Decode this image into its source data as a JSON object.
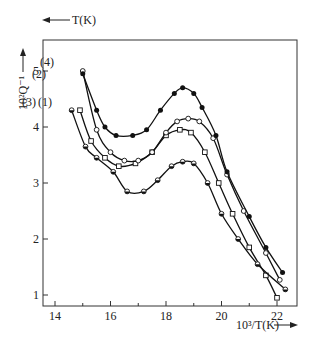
{
  "chart_data": {
    "type": "line",
    "title": "",
    "xlabel": "10³/T(K)",
    "ylabel": "10²Q⁻¹",
    "top_axis_label": "T(K)",
    "xlim": [
      13.6,
      22.8
    ],
    "ylim": [
      0.8,
      5.55
    ],
    "x_ticks": [
      14,
      16,
      18,
      20,
      22
    ],
    "y_ticks": [
      1,
      2,
      3,
      4,
      5
    ],
    "top_ticks": [
      700,
      600,
      500
    ],
    "grid": false,
    "legend": "inline labels (1)-(4)",
    "series": [
      {
        "name": "(1)",
        "marker": "open-square",
        "x": [
          14.9,
          15.3,
          15.8,
          16.3,
          16.9,
          17.5,
          18.0,
          18.5,
          18.9,
          19.4,
          19.9,
          20.4,
          21.0,
          21.6,
          22.0
        ],
        "y": [
          4.3,
          3.75,
          3.45,
          3.3,
          3.35,
          3.55,
          3.85,
          3.95,
          3.9,
          3.55,
          3.0,
          2.45,
          1.85,
          1.35,
          0.95
        ]
      },
      {
        "name": "(2)",
        "marker": "open-circle",
        "x": [
          15.0,
          15.5,
          16.0,
          16.5,
          17.0,
          17.5,
          18.0,
          18.4,
          18.8,
          19.2,
          19.7,
          20.2,
          20.8,
          21.6,
          22.1
        ],
        "y": [
          5.0,
          3.95,
          3.55,
          3.4,
          3.4,
          3.55,
          3.9,
          4.1,
          4.15,
          4.1,
          3.8,
          3.15,
          2.5,
          1.75,
          1.27
        ]
      },
      {
        "name": "(3)",
        "marker": "half-filled-circle",
        "x": [
          14.6,
          15.1,
          15.5,
          16.1,
          16.6,
          17.2,
          17.7,
          18.2,
          18.6,
          19.0,
          19.5,
          20.0,
          20.6,
          21.3,
          22.3
        ],
        "y": [
          4.3,
          3.65,
          3.45,
          3.2,
          2.85,
          2.85,
          3.05,
          3.3,
          3.38,
          3.35,
          3.0,
          2.45,
          2.0,
          1.55,
          1.1
        ]
      },
      {
        "name": "(4)",
        "marker": "filled-circle",
        "x": [
          15.0,
          15.5,
          15.8,
          16.2,
          16.8,
          17.3,
          17.8,
          18.3,
          18.6,
          19.0,
          19.3,
          19.8,
          20.2,
          21.0,
          21.6,
          22.2
        ],
        "y": [
          4.95,
          4.3,
          4.0,
          3.85,
          3.85,
          3.95,
          4.3,
          4.6,
          4.7,
          4.6,
          4.35,
          3.85,
          3.2,
          2.4,
          1.85,
          1.4
        ]
      }
    ]
  },
  "labels": {
    "xlabel": "10³/T(K)",
    "ylabel": "10²Q⁻¹",
    "top_label": "T(K)",
    "x_ticks": [
      "14",
      "16",
      "18",
      "20",
      "22"
    ],
    "y_ticks": [
      "1",
      "2",
      "3",
      "4",
      "5"
    ],
    "top_ticks": [
      "700",
      "600",
      "500"
    ],
    "series_labels": [
      "(1)",
      "(2)",
      "(3)",
      "(4)"
    ]
  }
}
